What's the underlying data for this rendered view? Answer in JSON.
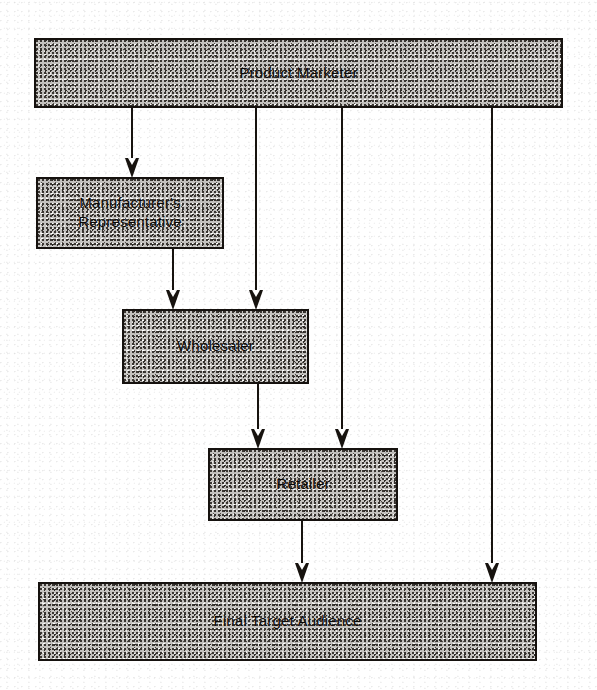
{
  "diagram": {
    "background_color": "#ffffff",
    "line_color": "#17130f",
    "box_fill_color": "#c4c2bf",
    "box_border_color": "#16120f",
    "nodes": [
      {
        "id": "product-marketer",
        "label": "Product Marketer",
        "x": 34,
        "y": 38,
        "w": 529,
        "h": 70,
        "lines": 1
      },
      {
        "id": "manufacturers-representative",
        "label": "Manufacturer's\nRepresentative",
        "x": 36,
        "y": 177,
        "w": 188,
        "h": 72,
        "lines": 2
      },
      {
        "id": "wholesaler",
        "label": "Wholesaler",
        "x": 122,
        "y": 309,
        "w": 187,
        "h": 75,
        "lines": 1
      },
      {
        "id": "retailer",
        "label": "Retailer",
        "x": 208,
        "y": 448,
        "w": 190,
        "h": 73,
        "lines": 1
      },
      {
        "id": "final-target-audience",
        "label": "Final Target Audience",
        "x": 38,
        "y": 582,
        "w": 499,
        "h": 79,
        "lines": 1
      }
    ],
    "connectors": [
      {
        "id": "marketer-to-manufacturers-rep",
        "from": "product-marketer",
        "to": "manufacturers-representative",
        "x": 132,
        "y_start": 108,
        "y_end": 177
      },
      {
        "id": "marketer-to-wholesaler",
        "from": "product-marketer",
        "to": "wholesaler",
        "x": 256,
        "y_start": 108,
        "y_end": 309
      },
      {
        "id": "marketer-to-retailer",
        "from": "product-marketer",
        "to": "retailer",
        "x": 342,
        "y_start": 108,
        "y_end": 448
      },
      {
        "id": "marketer-to-final-target-audience",
        "from": "product-marketer",
        "to": "final-target-audience",
        "x": 492,
        "y_start": 108,
        "y_end": 582
      },
      {
        "id": "manufacturers-rep-to-wholesaler",
        "from": "manufacturers-representative",
        "to": "wholesaler",
        "x": 173,
        "y_start": 249,
        "y_end": 309
      },
      {
        "id": "wholesaler-to-retailer",
        "from": "wholesaler",
        "to": "retailer",
        "x": 258,
        "y_start": 384,
        "y_end": 448
      },
      {
        "id": "retailer-to-final-target-audience",
        "from": "retailer",
        "to": "final-target-audience",
        "x": 302,
        "y_start": 521,
        "y_end": 582
      }
    ]
  }
}
